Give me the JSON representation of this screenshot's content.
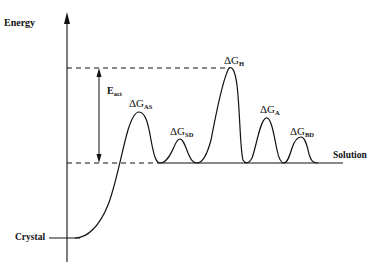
{
  "diagram": {
    "type": "energy-profile",
    "axis": {
      "y_label": "Energy"
    },
    "levels": {
      "top_label": "",
      "baseline_label": "Solution",
      "ground_label": "Crystal"
    },
    "activation": {
      "symbol": "E",
      "subscript": "act"
    },
    "barriers": [
      {
        "id": "AS",
        "symbol": "ΔG",
        "subscript": "AS"
      },
      {
        "id": "SD",
        "symbol": "ΔG",
        "subscript": "SD"
      },
      {
        "id": "H",
        "symbol": "ΔG",
        "subscript": "H"
      },
      {
        "id": "A",
        "symbol": "ΔG",
        "subscript": "A"
      },
      {
        "id": "BD",
        "symbol": "ΔG",
        "subscript": "BD"
      }
    ],
    "colors": {
      "stroke": "#111111",
      "background": "#ffffff"
    }
  }
}
